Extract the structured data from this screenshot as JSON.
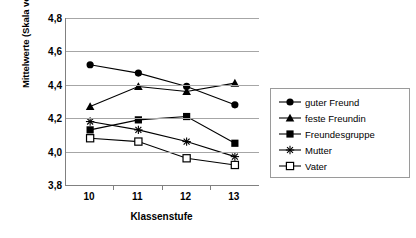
{
  "chart_data": {
    "type": "line",
    "title": "",
    "xlabel": "Klassenstufe",
    "ylabel": "Mittelwerte (Skala von 1 bis 5)",
    "categories": [
      "10",
      "11",
      "12",
      "13"
    ],
    "ylim": [
      3.8,
      4.8
    ],
    "yticks": [
      "3,8",
      "4,0",
      "4,2",
      "4,4",
      "4,6",
      "4,8"
    ],
    "ytick_values": [
      3.8,
      4.0,
      4.2,
      4.4,
      4.6,
      4.8
    ],
    "grid": "horizontal",
    "legend_position": "right",
    "decimal_separator": ",",
    "series": [
      {
        "name": "guter Freund",
        "marker": "filled-circle",
        "color": "#000000",
        "values": [
          4.52,
          4.47,
          4.39,
          4.28
        ]
      },
      {
        "name": "feste Freundin",
        "marker": "filled-triangle",
        "color": "#000000",
        "values": [
          4.27,
          4.39,
          4.36,
          4.41
        ]
      },
      {
        "name": "Freundesgruppe",
        "marker": "filled-square",
        "color": "#000000",
        "values": [
          4.13,
          4.19,
          4.21,
          4.05
        ]
      },
      {
        "name": "Mutter",
        "marker": "asterisk",
        "color": "#000000",
        "values": [
          4.18,
          4.13,
          4.06,
          3.97
        ]
      },
      {
        "name": "Vater",
        "marker": "open-square",
        "color": "#000000",
        "values": [
          4.08,
          4.06,
          3.96,
          3.92
        ]
      }
    ]
  }
}
